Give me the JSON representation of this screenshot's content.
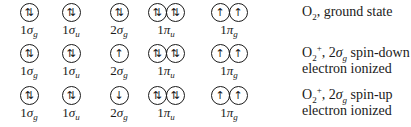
{
  "rows": [
    {
      "orbitals": [
        {
          "label_num": "1",
          "label_sym": "σ",
          "label_sub": "g",
          "occupancy": [
            "⇅"
          ]
        },
        {
          "label_num": "1",
          "label_sym": "σ",
          "label_sub": "u",
          "occupancy": [
            "⇅"
          ]
        },
        {
          "label_num": "2",
          "label_sym": "σ",
          "label_sub": "g",
          "occupancy": [
            "⇅"
          ]
        },
        {
          "label_num": "1",
          "label_sym": "π",
          "label_sub": "u",
          "occupancy": [
            "⇅",
            "⇅"
          ]
        },
        {
          "label_num": "1",
          "label_sym": "π",
          "label_sub": "g",
          "occupancy": [
            "↑",
            "↑"
          ]
        }
      ],
      "description": {
        "species": "O",
        "species_sub": "2",
        "species_sup": "",
        "line1_rest": ", ground state",
        "orbital": "",
        "orbital_sub": "",
        "line1_tail": "",
        "line2": ""
      }
    },
    {
      "orbitals": [
        {
          "label_num": "1",
          "label_sym": "σ",
          "label_sub": "g",
          "occupancy": [
            "⇅"
          ]
        },
        {
          "label_num": "1",
          "label_sym": "σ",
          "label_sub": "u",
          "occupancy": [
            "⇅"
          ]
        },
        {
          "label_num": "2",
          "label_sym": "σ",
          "label_sub": "g",
          "occupancy": [
            "↑"
          ]
        },
        {
          "label_num": "1",
          "label_sym": "π",
          "label_sub": "u",
          "occupancy": [
            "⇅",
            "⇅"
          ]
        },
        {
          "label_num": "1",
          "label_sym": "π",
          "label_sub": "g",
          "occupancy": [
            "↑",
            "↑"
          ]
        }
      ],
      "description": {
        "species": "O",
        "species_sub": "2",
        "species_sup": "+",
        "line1_rest": ", 2",
        "orbital": "σ",
        "orbital_sub": "g",
        "line1_tail": " spin-down",
        "line2": "electron ionized"
      }
    },
    {
      "orbitals": [
        {
          "label_num": "1",
          "label_sym": "σ",
          "label_sub": "g",
          "occupancy": [
            "⇅"
          ]
        },
        {
          "label_num": "1",
          "label_sym": "σ",
          "label_sub": "u",
          "occupancy": [
            "⇅"
          ]
        },
        {
          "label_num": "2",
          "label_sym": "σ",
          "label_sub": "g",
          "occupancy": [
            "↓"
          ]
        },
        {
          "label_num": "1",
          "label_sym": "π",
          "label_sub": "u",
          "occupancy": [
            "⇅",
            "⇅"
          ]
        },
        {
          "label_num": "1",
          "label_sym": "π",
          "label_sub": "g",
          "occupancy": [
            "↑",
            "↑"
          ]
        }
      ],
      "description": {
        "species": "O",
        "species_sub": "2",
        "species_sup": "+",
        "line1_rest": ", 2",
        "orbital": "σ",
        "orbital_sub": "g",
        "line1_tail": " spin-up",
        "line2": "electron ionized"
      }
    }
  ]
}
